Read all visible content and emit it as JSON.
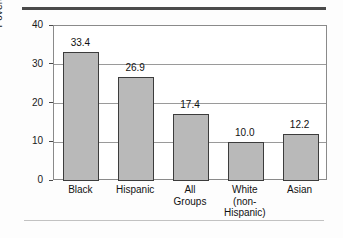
{
  "chart_data": {
    "type": "bar",
    "title": "",
    "xlabel": "",
    "ylabel": "Poverty rate",
    "ylim": [
      0,
      40
    ],
    "yticks": [
      "0",
      "10",
      "20",
      "30",
      "40"
    ],
    "grid": true,
    "legend": false,
    "categories": [
      "Black",
      "Hispanic",
      "All\nGroups",
      "White\n(non-\nHispanic)",
      "Asian"
    ],
    "values": [
      33.4,
      26.9,
      17.4,
      10.0,
      12.2
    ],
    "value_labels": [
      "33.4",
      "26.9",
      "17.4",
      "10.0",
      "12.2"
    ],
    "bar_color": "#b9b9b9",
    "bar_edge_color": "#3c3c3c"
  },
  "decor": {
    "top_rule_color": "#4a4a4a",
    "bottom_rule_color": "#c2c2c2"
  }
}
